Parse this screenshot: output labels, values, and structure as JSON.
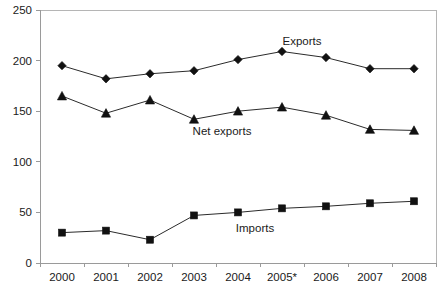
{
  "chart_data": {
    "type": "line",
    "title": "",
    "subtitle": "",
    "xlabel": "",
    "ylabel": "",
    "categories": [
      "2000",
      "2001",
      "2002",
      "2003",
      "2004",
      "2005*",
      "2006",
      "2007",
      "2008"
    ],
    "ylim": [
      0,
      250
    ],
    "yticks": [
      0,
      50,
      100,
      150,
      200,
      250
    ],
    "ytick_labels": [
      "0",
      "50",
      "100",
      "150",
      "200",
      "250"
    ],
    "grid": false,
    "legend_position": "inline-annotations",
    "series": [
      {
        "name": "Exports",
        "marker": "diamond",
        "values": [
          195,
          182,
          187,
          190,
          201,
          209,
          203,
          192,
          192
        ],
        "annotation": {
          "text": "Exports",
          "x_px": 302,
          "y_px": 45
        }
      },
      {
        "name": "Net exports",
        "marker": "triangle",
        "values": [
          165,
          148,
          161,
          142,
          150,
          154,
          146,
          132,
          131
        ],
        "annotation": {
          "text": "Net exports",
          "x_px": 222,
          "y_px": 135
        }
      },
      {
        "name": "Imports",
        "marker": "square",
        "values": [
          30,
          32,
          23,
          47,
          50,
          54,
          56,
          59,
          61
        ],
        "annotation": {
          "text": "Imports",
          "x_px": 255,
          "y_px": 232
        }
      }
    ],
    "colors": {
      "series_line": "#2b2b2b",
      "marker_fill": "#111111",
      "axis": "#9a9a9a",
      "plot_border": "#b5b5b5",
      "text": "#1a1a1a",
      "background": "#ffffff"
    }
  },
  "axes": {
    "plot_left_px": 40,
    "plot_right_px": 436,
    "plot_top_px": 10,
    "plot_bottom_px": 263
  }
}
